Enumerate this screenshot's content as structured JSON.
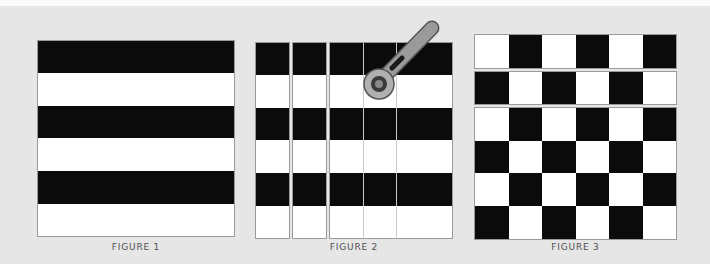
{
  "figures": [
    {
      "id": "figure-1",
      "caption": "FIGURE 1",
      "description": "Horizontal stripes: alternating black and white bands",
      "bands": [
        "black",
        "white",
        "black",
        "white",
        "black",
        "white"
      ]
    },
    {
      "id": "figure-2",
      "caption": "FIGURE 2",
      "description": "Striped fabric cut into vertical strips with a rotary cutter",
      "strips": 5,
      "bands": [
        "black",
        "white",
        "black",
        "white",
        "black",
        "white"
      ]
    },
    {
      "id": "figure-3",
      "caption": "FIGURE 3",
      "description": "Strips rearranged into a checkerboard pattern",
      "rows": 6,
      "cols": 6,
      "first_row_starts": "white"
    }
  ],
  "colors": {
    "background": "#e6e6e6",
    "black": "#0b0b0b",
    "white": "#ffffff",
    "cutter_handle": "#8c8c8c",
    "caption": "#505050"
  }
}
